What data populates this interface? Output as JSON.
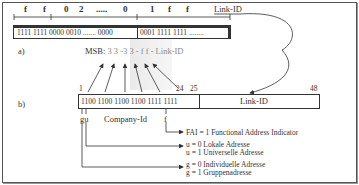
{
  "part_a": {
    "label": "a)",
    "hex_labels": [
      "f",
      "f",
      "0",
      "2",
      ".....",
      "0",
      "1",
      "f",
      "f"
    ],
    "link_id_label": "Link-ID",
    "bits_left": "1111 1111 0000 0010 ....... 0000",
    "bits_right": "0001 1111 1111 ........"
  },
  "msb": {
    "prefix": "MSB:",
    "sequence": "3 3 -3 3 - f f - Link-ID"
  },
  "part_b": {
    "label": "b)",
    "bit_start": "1",
    "bit_24": "24",
    "bit_25": "25",
    "bit_48": "48",
    "bits": "1100 1100 1100 1100 1111 1111",
    "link_id": "Link-ID",
    "gu_label": "gu",
    "company_label": "Company-Id",
    "f_label": "f"
  },
  "legend": {
    "fai": "FAI = 1 Functional Address Indicator",
    "u0": "u = 0 Lokale Adresse",
    "u1": "u = 1 Universelle Adresse",
    "g0": "g = 0 Individuelle Adresse",
    "g1": "g = 1 Gruppenadresse"
  },
  "colors": {
    "line": "#333333",
    "shade": "#eaeaea",
    "msb_gray": "#8a8a8a"
  }
}
